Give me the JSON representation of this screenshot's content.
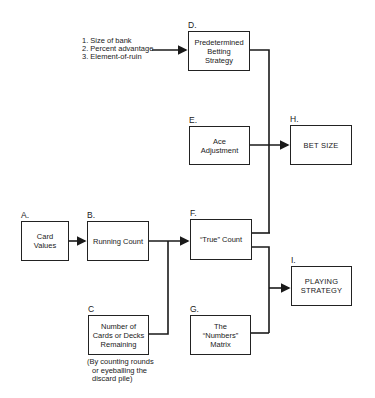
{
  "inputs_list": {
    "items": [
      "1. Size of bank",
      "2. Percent advantage",
      "3. Element-of-ruin"
    ]
  },
  "nodes": {
    "A": {
      "letter": "A.",
      "label": "Card\nValues"
    },
    "B": {
      "letter": "B.",
      "label": "Running Count"
    },
    "C": {
      "letter": "C",
      "label": "Number of\nCards or Decks\nRemaining"
    },
    "D": {
      "letter": "D.",
      "label": "Predetermined\nBetting\nStrategy"
    },
    "E": {
      "letter": "E.",
      "label": "Ace\nAdjustment"
    },
    "F": {
      "letter": "F.",
      "label": "“True” Count"
    },
    "G": {
      "letter": "G.",
      "label": "The\n“Numbers”\nMatrix"
    },
    "H": {
      "letter": "H.",
      "label": "BET SIZE"
    },
    "I": {
      "letter": "I.",
      "label": "PLAYING\nSTRATEGY"
    }
  },
  "c_note": {
    "lines": [
      "(By counting rounds",
      "or eyeballing the",
      "discard pile)"
    ]
  },
  "colors": {
    "line": "#1a1a1a",
    "background": "#ffffff"
  }
}
